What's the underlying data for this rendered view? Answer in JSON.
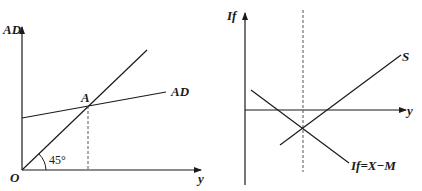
{
  "left_panel": {
    "y_axis_label": "AD",
    "x_axis_label": "y",
    "origin_label": "O",
    "angle_label": "45°",
    "point_label": "A",
    "curve_label": "AD"
  },
  "right_panel": {
    "y_axis_label": "If",
    "x_axis_label": "y",
    "saving_curve_label": "S",
    "net_export_curve_label": "If=X−M"
  },
  "colors": {
    "line": "#1a1a1a",
    "dashed": "#555555",
    "background": "#ffffff"
  }
}
